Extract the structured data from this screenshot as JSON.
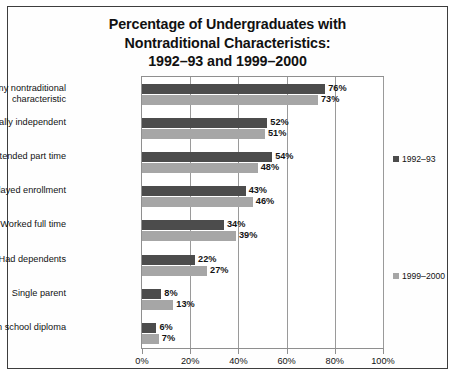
{
  "chart_data": {
    "type": "bar",
    "orientation": "horizontal",
    "title": "Percentage of Undergraduates with Nontraditional Characteristics: 1992–93 and 1999–2000",
    "title_lines": [
      "Percentage of Undergraduates with",
      "Nontraditional Characteristics:",
      "1992–93 and 1999–2000"
    ],
    "categories": [
      "Any nontraditional characteristic",
      "Financially independent",
      "Attended part time",
      "Delayed enrollment",
      "Worked full time",
      "Had dependents",
      "Single parent",
      "No high school diploma"
    ],
    "series": [
      {
        "name": "1992–93",
        "color": "#4c4c4c",
        "values": [
          76,
          52,
          54,
          43,
          34,
          22,
          8,
          6
        ],
        "labels": [
          "76%",
          "52%",
          "54%",
          "43%",
          "34%",
          "22%",
          "8%",
          "6%"
        ]
      },
      {
        "name": "1999–2000",
        "color": "#a6a6a6",
        "values": [
          73,
          51,
          48,
          46,
          39,
          27,
          13,
          7
        ],
        "labels": [
          "73%",
          "51%",
          "48%",
          "46%",
          "39%",
          "27%",
          "13%",
          "7%"
        ]
      }
    ],
    "xlabel": "",
    "ylabel": "",
    "xlim": [
      0,
      100
    ],
    "xticks": [
      0,
      20,
      40,
      60,
      80,
      100
    ],
    "xtick_labels": [
      "0%",
      "20%",
      "40%",
      "60%",
      "80%",
      "100%"
    ],
    "grid": true,
    "legend_position": "right"
  }
}
